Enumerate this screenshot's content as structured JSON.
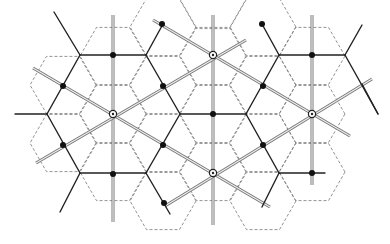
{
  "diagram": {
    "title": "",
    "colors": {
      "background": "#ffffff",
      "solid": "#222222",
      "dashed": "#777777",
      "double_line": "#777777"
    },
    "dashed_hex": {
      "radius": 33,
      "orientation": "flat-top",
      "centers_lattice": {
        "dx": 50,
        "dy": 29,
        "origin": [
          113,
          114
        ]
      },
      "centers": [
        [
          113,
          114
        ],
        [
          63,
          85
        ],
        [
          163,
          85
        ],
        [
          63,
          143
        ],
        [
          163,
          143
        ],
        [
          113,
          56
        ],
        [
          113,
          172
        ],
        [
          213,
          56
        ],
        [
          213,
          114
        ],
        [
          213,
          172
        ],
        [
          263,
          85
        ],
        [
          263,
          143
        ],
        [
          312,
          114
        ],
        [
          312,
          56
        ],
        [
          312,
          172
        ],
        [
          163,
          27
        ],
        [
          263,
          27
        ],
        [
          163,
          201
        ],
        [
          263,
          201
        ],
        [
          213,
          0
        ]
      ]
    },
    "solid_segments": [
      [
        80,
        55,
        146,
        55
      ],
      [
        47,
        114,
        80,
        55
      ],
      [
        146,
        55,
        180,
        114
      ],
      [
        47,
        114,
        80,
        173
      ],
      [
        180,
        114,
        146,
        173
      ],
      [
        80,
        173,
        146,
        173
      ],
      [
        180,
        114,
        246,
        114
      ],
      [
        246,
        114,
        279,
        55
      ],
      [
        279,
        55,
        345,
        55
      ],
      [
        345,
        55,
        378,
        114
      ],
      [
        246,
        114,
        279,
        173
      ],
      [
        279,
        173,
        325,
        173
      ],
      [
        146,
        55,
        163,
        24
      ],
      [
        279,
        55,
        262,
        24
      ],
      [
        80,
        55,
        54,
        12
      ],
      [
        146,
        173,
        170,
        214
      ],
      [
        80,
        173,
        60,
        212
      ],
      [
        279,
        173,
        262,
        207
      ],
      [
        378,
        114,
        362,
        84
      ],
      [
        345,
        55,
        362,
        25
      ],
      [
        15,
        114,
        47,
        114
      ]
    ],
    "double_lines": [
      [
        113,
        15,
        113,
        222
      ],
      [
        213,
        15,
        213,
        225
      ],
      [
        312,
        15,
        312,
        185
      ],
      [
        33,
        68,
        270,
        207
      ],
      [
        36,
        163,
        246,
        40
      ],
      [
        153,
        20,
        350,
        136
      ],
      [
        165,
        206,
        372,
        79
      ]
    ],
    "filled_nodes": [
      [
        113,
        55
      ],
      [
        63,
        86
      ],
      [
        163,
        86
      ],
      [
        63,
        145
      ],
      [
        163,
        145
      ],
      [
        113,
        174
      ],
      [
        213,
        114
      ],
      [
        263,
        86
      ],
      [
        263,
        145
      ],
      [
        312,
        55
      ],
      [
        312,
        173
      ],
      [
        162,
        24
      ],
      [
        262,
        24
      ],
      [
        164,
        203
      ]
    ],
    "ring_nodes": [
      [
        113,
        114
      ],
      [
        213,
        55
      ],
      [
        213,
        173
      ],
      [
        312,
        114
      ]
    ]
  }
}
